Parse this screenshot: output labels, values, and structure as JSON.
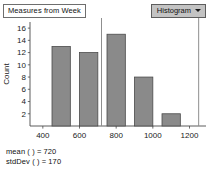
{
  "header": {
    "title_box_label": "Measures from Week",
    "plot_type_label": "Histogram",
    "caret_icon": "chevron-down-icon"
  },
  "footer": {
    "mean_line": "mean ( ) = 720",
    "stddev_line": "stdDev ( ) = 170"
  },
  "colors": {
    "bar_fill": "#8a8a8a",
    "bar_stroke": "#4a4a4a",
    "axis": "#4a4a4a",
    "reference_line": "#8f8f8f",
    "dropdown_bg": "#c3c3c3"
  },
  "chart_data": {
    "type": "bar",
    "title": "",
    "subtitle": "",
    "xlabel": "paycheck",
    "ylabel": "Count",
    "xlim": [
      330,
      1290
    ],
    "ylim": [
      0,
      17
    ],
    "grid": false,
    "legend": null,
    "x_ticks": [
      400,
      600,
      800,
      1000,
      1200
    ],
    "x_tick_labels": [
      "400",
      "600",
      "800",
      "1000",
      "1200"
    ],
    "y_ticks": [
      2,
      4,
      6,
      8,
      10,
      12,
      14,
      16
    ],
    "y_tick_labels": [
      "2",
      "4",
      "6",
      "8",
      "10",
      "12",
      "14",
      "16"
    ],
    "bin_width": 100,
    "bins": [
      {
        "x0": 450,
        "x1": 550,
        "value": 13
      },
      {
        "x0": 600,
        "x1": 700,
        "value": 12
      },
      {
        "x0": 750,
        "x1": 850,
        "value": 15
      },
      {
        "x0": 900,
        "x1": 1000,
        "value": 8
      },
      {
        "x0": 1050,
        "x1": 1150,
        "value": 2
      }
    ],
    "categories": [
      "450-550",
      "600-700",
      "750-850",
      "900-1000",
      "1050-1150"
    ],
    "values": [
      13,
      12,
      15,
      8,
      2
    ],
    "reference_lines": [
      {
        "name": "mean-marker",
        "x": 720
      },
      {
        "name": "right-boundary",
        "x": 1250
      }
    ]
  }
}
